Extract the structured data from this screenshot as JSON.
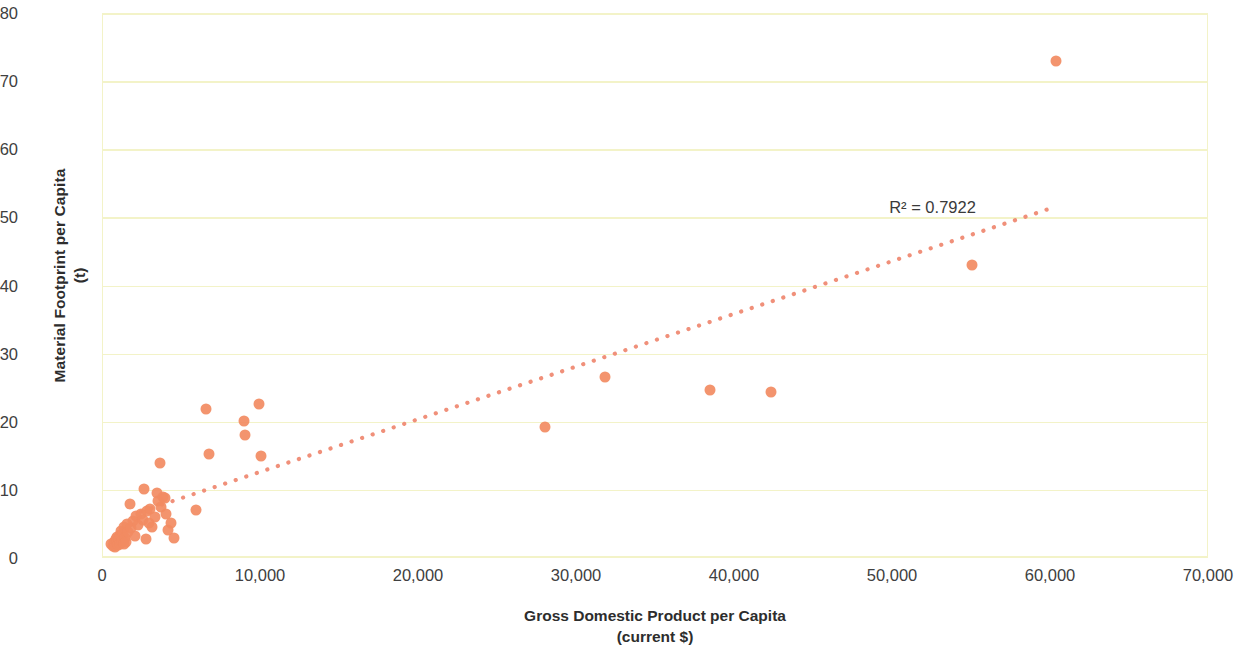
{
  "chart_data": {
    "type": "scatter",
    "title": "",
    "xlabel": "Gross Domestic Product per Capita",
    "xlabel_unit": "(current $)",
    "ylabel": "Material Footprint per Capita",
    "ylabel_unit": "(t)",
    "xlim": [
      0,
      70000
    ],
    "ylim": [
      0,
      80
    ],
    "xticks": [
      0,
      10000,
      20000,
      30000,
      40000,
      50000,
      60000,
      70000
    ],
    "xtick_labels": [
      "0",
      "10,000",
      "20,000",
      "30,000",
      "40,000",
      "50,000",
      "60,000",
      "70,000"
    ],
    "yticks": [
      0,
      10,
      20,
      30,
      40,
      50,
      60,
      70,
      80
    ],
    "ytick_labels": [
      "0",
      "10",
      "20",
      "30",
      "40",
      "50",
      "60",
      "70",
      "80"
    ],
    "grid": true,
    "grid_color": "#f3f3c8",
    "legend": false,
    "marker_color": "#f28b62",
    "marker_size": 11,
    "annotations": [
      {
        "text": "R² = 0.7922",
        "x": 52500,
        "y": 51.5
      }
    ],
    "trendline": {
      "style": "dotted",
      "color": "#f0907a",
      "r_squared": 0.7922,
      "x_start": 2400,
      "y_start": 6.8,
      "x_end": 60200,
      "y_end": 51.5
    },
    "series": [
      {
        "name": "Countries",
        "points": [
          [
            500,
            2.0
          ],
          [
            620,
            1.8
          ],
          [
            700,
            2.4
          ],
          [
            760,
            1.6
          ],
          [
            800,
            2.8
          ],
          [
            860,
            2.2
          ],
          [
            900,
            3.1
          ],
          [
            950,
            1.9
          ],
          [
            1000,
            2.6
          ],
          [
            1050,
            3.4
          ],
          [
            1100,
            2.1
          ],
          [
            1150,
            4.0
          ],
          [
            1200,
            2.5
          ],
          [
            1250,
            3.6
          ],
          [
            1300,
            2.0
          ],
          [
            1350,
            4.6
          ],
          [
            1400,
            3.0
          ],
          [
            1450,
            2.3
          ],
          [
            1500,
            5.0
          ],
          [
            1600,
            3.8
          ],
          [
            1700,
            7.9
          ],
          [
            1800,
            4.4
          ],
          [
            1900,
            5.4
          ],
          [
            2000,
            3.2
          ],
          [
            2100,
            6.1
          ],
          [
            2200,
            4.9
          ],
          [
            2400,
            6.5
          ],
          [
            2500,
            5.6
          ],
          [
            2600,
            10.2
          ],
          [
            2700,
            2.8
          ],
          [
            2800,
            6.9
          ],
          [
            2900,
            5.1
          ],
          [
            3000,
            7.2
          ],
          [
            3100,
            4.6
          ],
          [
            3300,
            6.0
          ],
          [
            3400,
            9.6
          ],
          [
            3500,
            8.4
          ],
          [
            3600,
            14.0
          ],
          [
            3700,
            7.5
          ],
          [
            3800,
            9.0
          ],
          [
            3900,
            8.8
          ],
          [
            4000,
            6.4
          ],
          [
            4100,
            4.1
          ],
          [
            4300,
            5.2
          ],
          [
            4500,
            3.0
          ],
          [
            5900,
            7.1
          ],
          [
            6500,
            21.8
          ],
          [
            6700,
            15.3
          ],
          [
            8900,
            20.1
          ],
          [
            9000,
            18.1
          ],
          [
            9900,
            22.6
          ],
          [
            10000,
            15.0
          ],
          [
            28000,
            19.3
          ],
          [
            31800,
            26.5
          ],
          [
            38400,
            24.7
          ],
          [
            42300,
            24.3
          ],
          [
            55000,
            43.0
          ],
          [
            60300,
            73.0
          ]
        ]
      }
    ]
  }
}
